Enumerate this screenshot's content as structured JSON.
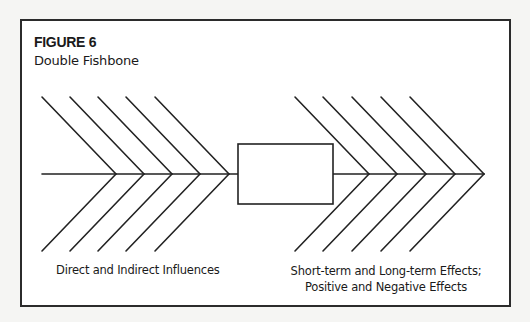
{
  "figure": {
    "label": "FIGURE 6",
    "title": "Double Fishbone"
  },
  "diagram": {
    "type": "double-fishbone",
    "spine_y": 174,
    "spine_x_start": 42,
    "spine_x_end": 484,
    "center_box": {
      "x": 238,
      "y": 144,
      "width": 95,
      "height": 60,
      "label": ""
    },
    "left_fishbone": {
      "apexes_x": [
        116,
        144,
        172,
        200,
        229
      ],
      "rib_dx": 74,
      "rib_dy": 77,
      "caption": "Direct and Indirect Influences"
    },
    "right_fishbone": {
      "apexes_x": [
        369,
        397,
        426,
        455,
        484
      ],
      "rib_dx": 74,
      "rib_dy": 77,
      "caption_lines": [
        "Short-term and Long-term Effects;",
        "Positive and Negative Effects"
      ]
    },
    "stroke_color": "#222222"
  }
}
